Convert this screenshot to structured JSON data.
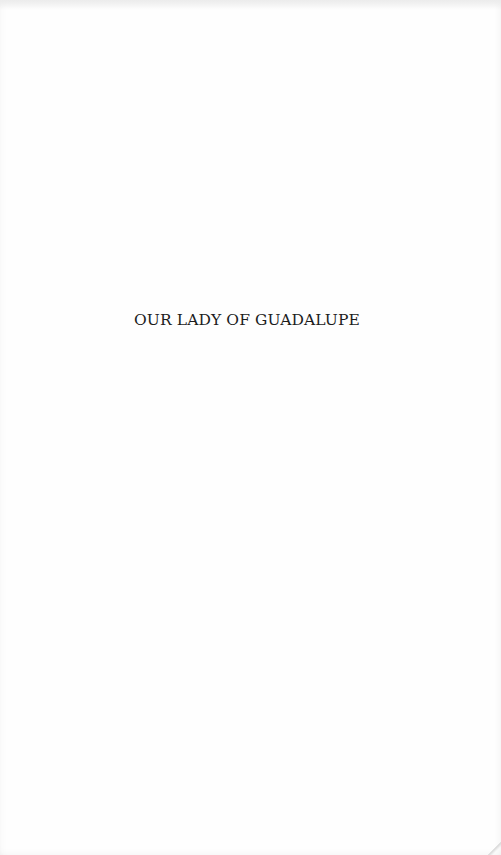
{
  "page": {
    "type": "half-title",
    "title": "OUR LADY OF GUADALUPE",
    "background_color": "#fefefe",
    "text_color": "#1c1c1c"
  }
}
